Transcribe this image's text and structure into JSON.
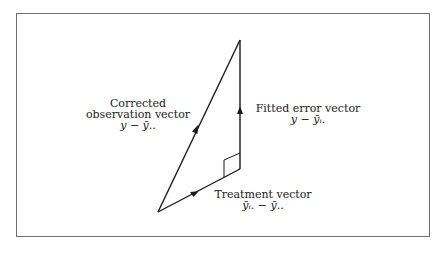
{
  "diagram": {
    "type": "vector-triangle",
    "vectors": [
      {
        "id": "corrected-observation",
        "title": "Corrected observation vector",
        "title_line1": "Corrected",
        "title_line2": "observation vector",
        "expression": "y − ȳ.."
      },
      {
        "id": "fitted-error",
        "title": "Fitted error vector",
        "expression": "y − ȳᵢ."
      },
      {
        "id": "treatment",
        "title": "Treatment vector",
        "expression": "ȳᵢ. − ȳ.."
      }
    ],
    "annotations": [
      "right-angle between treatment vector and fitted error vector"
    ],
    "colors": {
      "line": "#1a1a1a",
      "frame": "#6e6e6e",
      "background": "#ffffff"
    }
  }
}
